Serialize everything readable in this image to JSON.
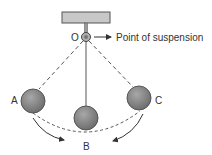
{
  "diagram": {
    "type": "pendulum-oscillation",
    "labels": {
      "pivot": "O",
      "pivot_callout": "Point of suspension",
      "left_extreme": "A",
      "mean_position": "B",
      "right_extreme": "C"
    },
    "colors": {
      "bob_fill": "#8a8a8a",
      "bob_stroke": "#555555",
      "support_fill": "#c8c8c8",
      "line": "#555555",
      "text": "#333333"
    }
  }
}
